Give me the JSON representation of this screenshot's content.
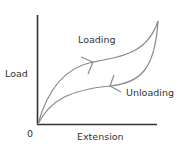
{
  "diagram": {
    "axes": {
      "y_label": "Load",
      "x_label": "Extension",
      "origin_label": "0"
    },
    "curves": [
      {
        "name": "Loading",
        "label": "Loading",
        "direction": "forward",
        "color": "#8a8a8a"
      },
      {
        "name": "Unloading",
        "label": "Unloading",
        "direction": "backward",
        "color": "#8a8a8a"
      }
    ],
    "colors": {
      "axis": "#333333",
      "curve": "#8a8a8a",
      "text": "#333333"
    }
  }
}
